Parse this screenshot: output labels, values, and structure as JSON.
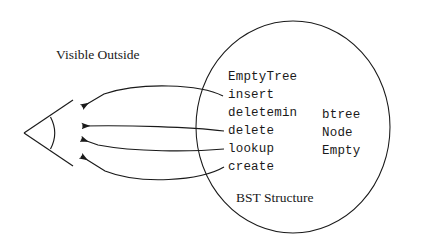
{
  "figure": {
    "title_external": "Visible Outside",
    "caption_internal": "BST Structure",
    "background_color": "#ffffff",
    "ink_color": "#1a1a1a"
  },
  "boundary": {
    "name": "BST Structure",
    "shape": "ellipse"
  },
  "viewer": {
    "name": "eye-symbol",
    "description": "wedge with arc"
  },
  "operations": [
    {
      "label": "EmptyTree",
      "exported": false
    },
    {
      "label": "insert",
      "exported": true
    },
    {
      "label": "deletemin",
      "exported": false
    },
    {
      "label": "delete",
      "exported": true
    },
    {
      "label": "lookup",
      "exported": true
    },
    {
      "label": "create",
      "exported": true
    }
  ],
  "types": [
    {
      "label": "btree"
    },
    {
      "label": "Node"
    },
    {
      "label": "Empty"
    }
  ],
  "arrows": [
    {
      "from": "insert",
      "to": "viewer"
    },
    {
      "from": "delete",
      "to": "viewer"
    },
    {
      "from": "lookup",
      "to": "viewer"
    },
    {
      "from": "create",
      "to": "viewer"
    }
  ]
}
